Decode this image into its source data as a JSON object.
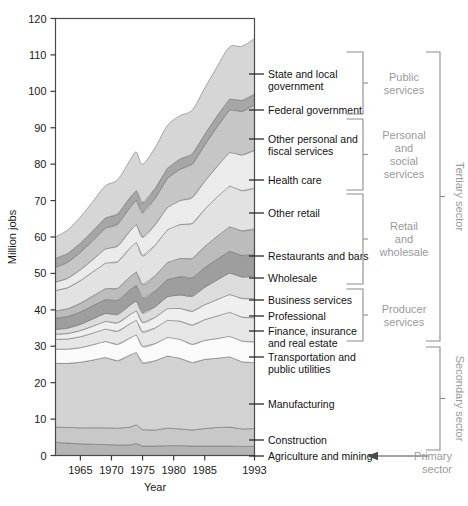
{
  "chart_data": {
    "type": "area",
    "stacked": true,
    "title": "",
    "xlabel": "Year",
    "ylabel": "Million jobs",
    "xlim": [
      1961,
      1993
    ],
    "ylim": [
      0,
      120
    ],
    "ytick_step": 10,
    "yticks": [
      0,
      10,
      20,
      30,
      40,
      50,
      60,
      70,
      80,
      90,
      100,
      110,
      120
    ],
    "xticks": [
      1965,
      1970,
      1975,
      1980,
      1985,
      1993
    ],
    "xtick_labels": [
      "1965",
      "1970",
      "1975",
      "1980",
      "1985",
      "1993"
    ],
    "grid": false,
    "legend_position": "right-inline-labels",
    "x": [
      1961,
      1963,
      1965,
      1967,
      1969,
      1971,
      1973,
      1974,
      1975,
      1977,
      1979,
      1981,
      1983,
      1985,
      1987,
      1989,
      1991,
      1993
    ],
    "series": [
      {
        "name": "Agriculture and mining",
        "color": "#b4b4b4",
        "values": [
          3.6,
          3.4,
          3.2,
          3.1,
          3.0,
          2.9,
          2.9,
          3.3,
          2.6,
          2.6,
          2.7,
          2.7,
          2.6,
          2.6,
          2.6,
          2.6,
          2.5,
          2.5
        ]
      },
      {
        "name": "Construction",
        "color": "#c8c8c8",
        "values": [
          4.2,
          4.3,
          4.4,
          4.5,
          4.6,
          4.6,
          4.9,
          5.1,
          4.5,
          4.4,
          4.8,
          4.6,
          4.4,
          4.8,
          5.1,
          5.2,
          4.8,
          4.9
        ]
      },
      {
        "name": "Manufacturing",
        "color": "#d2d2d2",
        "values": [
          17.5,
          17.6,
          18.0,
          18.6,
          19.3,
          18.5,
          19.8,
          19.9,
          18.3,
          19.0,
          19.8,
          19.4,
          18.5,
          19.0,
          19.0,
          19.3,
          18.4,
          18.1
        ]
      },
      {
        "name": "Transportation and public utilities",
        "color": "#fafafa",
        "values": [
          3.9,
          3.9,
          4.0,
          4.2,
          4.4,
          4.5,
          4.7,
          4.8,
          4.5,
          4.7,
          5.1,
          5.2,
          5.0,
          5.2,
          5.4,
          5.6,
          5.7,
          5.7
        ]
      },
      {
        "name": "Finance, insurance and real estate",
        "color": "#e6e6e6",
        "values": [
          2.7,
          2.8,
          3.0,
          3.2,
          3.4,
          3.6,
          3.9,
          4.0,
          4.0,
          4.3,
          4.7,
          5.0,
          5.3,
          5.7,
          6.2,
          6.6,
          6.6,
          6.6
        ]
      },
      {
        "name": "Professional",
        "color": "#efefef",
        "values": [
          1.4,
          1.5,
          1.7,
          1.9,
          2.1,
          2.3,
          2.5,
          2.6,
          2.6,
          2.9,
          3.2,
          3.5,
          3.8,
          4.1,
          4.5,
          4.9,
          5.1,
          5.3
        ]
      },
      {
        "name": "Business services",
        "color": "#dcdcdc",
        "values": [
          1.3,
          1.5,
          1.7,
          2.0,
          2.2,
          2.3,
          2.6,
          2.7,
          2.6,
          2.9,
          3.3,
          3.7,
          4.1,
          4.8,
          5.4,
          5.9,
          5.9,
          6.2
        ]
      },
      {
        "name": "Wholesale",
        "color": "#9e9e9e",
        "values": [
          3.1,
          3.2,
          3.4,
          3.6,
          3.8,
          3.9,
          4.2,
          4.3,
          4.1,
          4.3,
          4.7,
          5.0,
          5.1,
          5.4,
          5.7,
          6.0,
          5.9,
          5.9
        ]
      },
      {
        "name": "Restaurants and bars",
        "color": "#bcbcbc",
        "values": [
          2.0,
          2.1,
          2.4,
          2.7,
          3.0,
          3.3,
          3.6,
          3.7,
          3.7,
          4.2,
          4.7,
          5.0,
          5.3,
          5.8,
          6.3,
          6.7,
          6.8,
          7.0
        ]
      },
      {
        "name": "Other retail",
        "color": "#e2e2e2",
        "values": [
          5.6,
          5.8,
          6.2,
          6.6,
          7.0,
          7.3,
          7.9,
          8.1,
          7.9,
          8.4,
          9.0,
          9.3,
          9.6,
          10.2,
          10.8,
          11.2,
          11.0,
          11.2
        ]
      },
      {
        "name": "Health care",
        "color": "#ebebeb",
        "values": [
          2.3,
          2.6,
          3.0,
          3.4,
          3.9,
          4.3,
          4.7,
          4.9,
          5.1,
          5.6,
          6.1,
          6.6,
          7.1,
          7.7,
          8.4,
          9.2,
          9.8,
          10.4
        ]
      },
      {
        "name": "Other personal and fiscal services",
        "color": "#c6c6c6",
        "values": [
          4.1,
          4.4,
          4.8,
          5.2,
          5.7,
          6.0,
          6.5,
          6.7,
          6.7,
          7.3,
          8.0,
          8.6,
          9.2,
          10.0,
          10.9,
          11.7,
          12.0,
          12.5
        ]
      },
      {
        "name": "Federal government",
        "color": "#a6a6a6",
        "values": [
          2.4,
          2.4,
          2.5,
          2.7,
          2.8,
          2.8,
          2.7,
          2.7,
          2.7,
          2.7,
          2.8,
          2.8,
          2.8,
          2.9,
          3.0,
          3.0,
          3.0,
          2.9
        ]
      },
      {
        "name": "State and local government",
        "color": "#d6d6d6",
        "values": [
          5.9,
          6.5,
          7.2,
          8.0,
          8.8,
          9.5,
          10.2,
          10.5,
          10.7,
          11.2,
          11.7,
          11.9,
          12.1,
          12.7,
          13.5,
          14.3,
          14.9,
          15.3
        ]
      }
    ]
  },
  "axis": {
    "ylabel": "Million jobs",
    "xlabel": "Year"
  },
  "band_labels": [
    {
      "id": "state-and-local-government",
      "lines": [
        "State and local",
        "government"
      ],
      "y": 74
    },
    {
      "id": "federal-government",
      "lines": [
        "Federal government"
      ],
      "y": 110
    },
    {
      "id": "other-personal-and-fiscal-services",
      "lines": [
        "Other personal and",
        "fiscal services"
      ],
      "y": 139
    },
    {
      "id": "health-care",
      "lines": [
        "Health care"
      ],
      "y": 180
    },
    {
      "id": "other-retail",
      "lines": [
        "Other retail"
      ],
      "y": 213
    },
    {
      "id": "restaurants-and-bars",
      "lines": [
        "Restaurants and bars"
      ],
      "y": 256
    },
    {
      "id": "wholesale",
      "lines": [
        "Wholesale"
      ],
      "y": 278
    },
    {
      "id": "business-services",
      "lines": [
        "Business services"
      ],
      "y": 300
    },
    {
      "id": "professional",
      "lines": [
        "Professional"
      ],
      "y": 316
    },
    {
      "id": "finance-insurance-and-real-estate",
      "lines": [
        "Finance, insurance",
        "and real estate"
      ],
      "y": 331
    },
    {
      "id": "transportation-and-public-utilities",
      "lines": [
        "Transportation and",
        "public utilities"
      ],
      "y": 357
    },
    {
      "id": "manufacturing",
      "lines": [
        "Manufacturing"
      ],
      "y": 404
    },
    {
      "id": "construction",
      "lines": [
        "Construction"
      ],
      "y": 440
    },
    {
      "id": "agriculture-and-mining",
      "lines": [
        "Agriculture and mining"
      ],
      "y": 456
    }
  ],
  "groups": [
    {
      "id": "public-services",
      "lines": [
        "Public",
        "services"
      ],
      "top": 52,
      "bottom": 114,
      "tone": "light"
    },
    {
      "id": "personal-and-social-services",
      "lines": [
        "Personal",
        "and",
        "social",
        "services"
      ],
      "top": 119,
      "bottom": 190,
      "tone": "light"
    },
    {
      "id": "retail-and-wholesale",
      "lines": [
        "Retail",
        "and",
        "wholesale"
      ],
      "top": 194,
      "bottom": 284,
      "tone": "light"
    },
    {
      "id": "producer-services",
      "lines": [
        "Producer",
        "services"
      ],
      "top": 289,
      "bottom": 341,
      "tone": "light"
    },
    {
      "id": "secondary-sector",
      "lines": [
        "Secondary sector"
      ],
      "top": 347,
      "bottom": 450,
      "tone": "light",
      "rotated": true
    },
    {
      "id": "tertiary-sector",
      "lines": [
        "Tertiary sector"
      ],
      "top": 52,
      "bottom": 341,
      "tone": "light",
      "rotated": true
    },
    {
      "id": "primary-sector",
      "lines": [
        "Primary",
        "sector"
      ],
      "top": 450,
      "bottom": 468,
      "tone": "light"
    }
  ]
}
